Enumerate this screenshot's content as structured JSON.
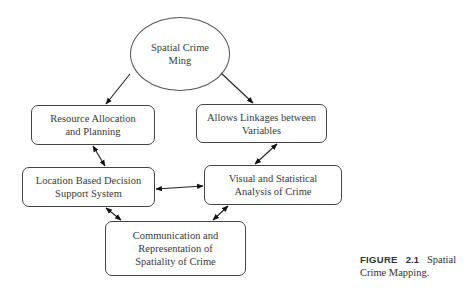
{
  "diagram": {
    "nodes": {
      "root": {
        "label": "Spatial Crime Ming",
        "line1": "Spatial Crime",
        "line2": "Ming"
      },
      "resource": {
        "line1": "Resource Allocation",
        "line2": "and Planning"
      },
      "linkages": {
        "line1": "Allows Linkages between",
        "line2": "Variables"
      },
      "location": {
        "line1": "Location Based Decision",
        "line2": "Support System"
      },
      "visual": {
        "line1": "Visual and Statistical",
        "line2": "Analysis of Crime"
      },
      "communication": {
        "line1": "Communication and",
        "line2": "Representation of",
        "line3": "Spatiality of Crime"
      }
    },
    "edges": [
      {
        "from": "root",
        "to": "resource",
        "type": "directed"
      },
      {
        "from": "root",
        "to": "linkages",
        "type": "directed"
      },
      {
        "from": "resource",
        "to": "location",
        "type": "bidirectional"
      },
      {
        "from": "linkages",
        "to": "visual",
        "type": "bidirectional"
      },
      {
        "from": "location",
        "to": "visual",
        "type": "bidirectional"
      },
      {
        "from": "location",
        "to": "communication",
        "type": "bidirectional"
      },
      {
        "from": "visual",
        "to": "communication",
        "type": "bidirectional"
      }
    ]
  },
  "caption": {
    "label": "FIGURE",
    "number": "2.1",
    "text_line1": "Spatial",
    "text_line2": "Crime Mapping."
  }
}
